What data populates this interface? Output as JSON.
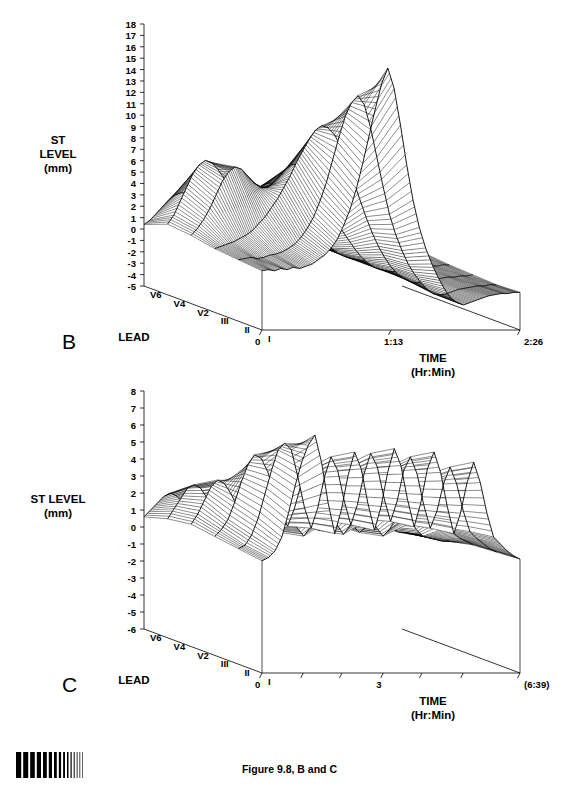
{
  "figure": {
    "caption": "Figure 9.8, B and C",
    "density_bar_name": "density-calibration-bar"
  },
  "panels": [
    {
      "id": "B",
      "letter": "B",
      "z_axis": {
        "title_lines": [
          "ST",
          "LEVEL",
          "(mm)"
        ],
        "ticks": [
          18,
          17,
          16,
          15,
          14,
          13,
          12,
          11,
          10,
          9,
          8,
          7,
          6,
          5,
          4,
          3,
          2,
          1,
          0,
          -1,
          -2,
          -3,
          -4,
          -5
        ],
        "min": -5,
        "max": 18
      },
      "lead_axis": {
        "title": "LEAD",
        "labels": [
          "V6",
          "V4",
          "V2",
          "III",
          "II",
          "I"
        ]
      },
      "time_axis": {
        "title_lines": [
          "TIME",
          "(Hr:Min)"
        ],
        "tick_labels": [
          "0",
          "1:13",
          "2:26"
        ],
        "tick_positions": [
          0,
          0.5,
          1.0
        ]
      }
    },
    {
      "id": "C",
      "letter": "C",
      "z_axis": {
        "title_lines": [
          "ST LEVEL",
          "(mm)"
        ],
        "ticks": [
          8,
          7,
          6,
          5,
          4,
          3,
          2,
          1,
          0,
          -1,
          -2,
          -3,
          -4,
          -5,
          -6
        ],
        "min": -6,
        "max": 8
      },
      "lead_axis": {
        "title": "LEAD",
        "labels": [
          "V6",
          "V4",
          "V2",
          "III",
          "II",
          "I"
        ]
      },
      "time_axis": {
        "title_lines": [
          "TIME",
          "(Hr:Min)"
        ],
        "tick_labels": [
          "0",
          "3",
          "(6:39)"
        ],
        "tick_positions": [
          0,
          0.47,
          1.0
        ],
        "minor_tick_positions": [
          0.16,
          0.31,
          0.62,
          0.78
        ]
      }
    }
  ],
  "chart_data": [
    {
      "type": "surface",
      "panel": "B",
      "title": "",
      "xlabel": "TIME (Hr:Min)",
      "ylabel": "LEAD",
      "zlabel": "ST LEVEL (mm)",
      "zlim": [
        -5,
        18
      ],
      "xlim_labels": [
        "0",
        "2:26"
      ],
      "grid": false,
      "legend": "none",
      "y_categories": [
        "I",
        "II",
        "III",
        "V2",
        "V4",
        "V6"
      ],
      "x_count": 42,
      "series": [
        {
          "name": "I",
          "values": [
            0.2,
            0.3,
            0.2,
            0.4,
            0.3,
            0.5,
            0.4,
            0.6,
            0.8,
            1.2,
            1.6,
            2.2,
            3.0,
            4.2,
            5.6,
            7.4,
            9.6,
            12.0,
            14.4,
            16.6,
            18.0,
            16.2,
            13.0,
            9.5,
            6.4,
            4.0,
            2.2,
            0.8,
            -0.4,
            -1.4,
            -2.2,
            -2.6,
            -2.8,
            -2.6,
            -2.4,
            -2.2,
            -2.0,
            -1.9,
            -1.8,
            -1.8,
            -1.7,
            -1.7
          ]
        },
        {
          "name": "II",
          "values": [
            0.4,
            0.5,
            0.6,
            0.5,
            0.6,
            0.8,
            0.9,
            1.1,
            1.4,
            1.8,
            2.4,
            3.2,
            4.2,
            5.6,
            7.2,
            9.2,
            11.2,
            13.0,
            14.2,
            14.8,
            14.0,
            12.0,
            9.4,
            6.8,
            4.4,
            2.6,
            1.2,
            0.0,
            -0.9,
            -1.6,
            -2.2,
            -2.6,
            -2.7,
            -2.6,
            -2.4,
            -2.2,
            -2.1,
            -2.0,
            -1.9,
            -1.9,
            -1.8,
            -1.8
          ]
        },
        {
          "name": "III",
          "values": [
            0.6,
            0.8,
            1.0,
            1.2,
            1.5,
            1.8,
            2.2,
            2.8,
            3.4,
            4.2,
            5.0,
            6.0,
            7.0,
            8.2,
            9.2,
            10.2,
            11.0,
            11.4,
            11.2,
            10.6,
            9.6,
            8.2,
            6.6,
            5.0,
            3.4,
            2.0,
            0.8,
            -0.2,
            -1.0,
            -1.6,
            -2.0,
            -2.3,
            -2.4,
            -2.3,
            -2.2,
            -2.1,
            -2.0,
            -1.9,
            -1.9,
            -1.8,
            -1.8,
            -1.7
          ]
        },
        {
          "name": "V2",
          "values": [
            1.0,
            1.6,
            2.4,
            3.4,
            4.6,
            5.8,
            6.6,
            7.0,
            6.8,
            6.2,
            5.6,
            5.2,
            5.2,
            5.6,
            6.2,
            6.8,
            7.2,
            7.2,
            6.8,
            6.2,
            5.4,
            4.4,
            3.4,
            2.4,
            1.4,
            0.6,
            -0.2,
            -0.9,
            -1.4,
            -1.8,
            -2.0,
            -2.1,
            -2.2,
            -2.1,
            -2.0,
            -1.9,
            -1.8,
            -1.8,
            -1.7,
            -1.7,
            -1.6,
            -1.6
          ]
        },
        {
          "name": "V4",
          "values": [
            1.2,
            2.0,
            3.2,
            4.4,
            5.6,
            6.4,
            6.8,
            6.6,
            6.0,
            5.2,
            4.4,
            3.8,
            3.6,
            3.8,
            4.2,
            4.6,
            4.8,
            4.8,
            4.4,
            3.8,
            3.2,
            2.4,
            1.6,
            0.9,
            0.2,
            -0.4,
            -0.9,
            -1.3,
            -1.6,
            -1.8,
            -1.9,
            -2.0,
            -2.0,
            -1.9,
            -1.8,
            -1.8,
            -1.7,
            -1.6,
            -1.6,
            -1.5,
            -1.5,
            -1.4
          ]
        },
        {
          "name": "V6",
          "values": [
            0.4,
            0.8,
            1.4,
            2.0,
            2.6,
            3.0,
            3.2,
            3.0,
            2.6,
            2.2,
            1.8,
            1.6,
            1.5,
            1.6,
            1.8,
            2.0,
            2.0,
            1.9,
            1.7,
            1.4,
            1.0,
            0.6,
            0.2,
            -0.2,
            -0.6,
            -0.9,
            -1.2,
            -1.4,
            -1.5,
            -1.6,
            -1.7,
            -1.7,
            -1.7,
            -1.6,
            -1.6,
            -1.5,
            -1.5,
            -1.4,
            -1.4,
            -1.3,
            -1.3,
            -1.2
          ]
        }
      ]
    },
    {
      "type": "surface",
      "panel": "C",
      "title": "",
      "xlabel": "TIME (Hr:Min)",
      "ylabel": "LEAD",
      "zlabel": "ST LEVEL (mm)",
      "zlim": [
        -6,
        8
      ],
      "xlim_labels": [
        "0",
        "(6:39)"
      ],
      "grid": false,
      "legend": "none",
      "y_categories": [
        "I",
        "II",
        "III",
        "V2",
        "V4",
        "V6"
      ],
      "x_count": 40,
      "series": [
        {
          "name": "I",
          "values": [
            0.6,
            0.8,
            1.2,
            2.0,
            3.4,
            5.0,
            6.4,
            7.4,
            8.0,
            6.4,
            4.0,
            2.2,
            3.6,
            5.6,
            7.0,
            6.0,
            4.0,
            2.4,
            3.8,
            5.8,
            7.2,
            6.2,
            4.2,
            2.6,
            4.0,
            6.0,
            7.0,
            5.8,
            3.8,
            2.2,
            3.4,
            5.2,
            6.4,
            5.2,
            3.4,
            2.0,
            1.6,
            1.2,
            0.9,
            0.7
          ]
        },
        {
          "name": "II",
          "values": [
            0.8,
            1.0,
            1.6,
            2.6,
            4.0,
            5.4,
            6.6,
            7.0,
            6.6,
            5.0,
            3.2,
            2.0,
            3.2,
            5.0,
            6.2,
            5.4,
            3.6,
            2.2,
            3.4,
            5.2,
            6.4,
            5.6,
            3.8,
            2.4,
            3.6,
            5.4,
            6.2,
            5.2,
            3.4,
            2.0,
            3.0,
            4.6,
            5.6,
            4.6,
            3.0,
            1.8,
            1.4,
            1.1,
            0.8,
            0.6
          ]
        },
        {
          "name": "III",
          "values": [
            1.0,
            1.4,
            2.0,
            3.0,
            4.2,
            5.2,
            5.8,
            5.6,
            4.8,
            3.6,
            2.4,
            1.6,
            2.6,
            4.0,
            5.0,
            4.4,
            3.0,
            1.9,
            2.8,
            4.2,
            5.2,
            4.6,
            3.2,
            2.0,
            3.0,
            4.4,
            5.0,
            4.2,
            2.8,
            1.7,
            2.5,
            3.8,
            4.6,
            3.8,
            2.5,
            1.5,
            1.2,
            0.9,
            0.7,
            0.5
          ]
        },
        {
          "name": "V2",
          "values": [
            1.2,
            1.8,
            2.6,
            3.4,
            3.8,
            3.6,
            3.0,
            2.2,
            1.4,
            0.8,
            0.4,
            0.2,
            0.8,
            1.6,
            2.2,
            1.8,
            1.0,
            0.5,
            1.0,
            1.8,
            2.4,
            2.0,
            1.2,
            0.6,
            1.1,
            1.9,
            2.2,
            1.8,
            1.0,
            0.5,
            0.9,
            1.6,
            2.0,
            1.6,
            0.9,
            0.5,
            0.4,
            0.3,
            0.2,
            0.2
          ]
        },
        {
          "name": "V4",
          "values": [
            1.0,
            1.6,
            2.2,
            2.8,
            3.0,
            2.8,
            2.2,
            1.6,
            1.0,
            0.5,
            0.2,
            0.0,
            0.4,
            1.0,
            1.5,
            1.2,
            0.6,
            0.2,
            0.6,
            1.2,
            1.6,
            1.3,
            0.7,
            0.3,
            0.7,
            1.3,
            1.5,
            1.2,
            0.6,
            0.2,
            0.5,
            1.0,
            1.3,
            1.0,
            0.5,
            0.2,
            0.2,
            0.1,
            0.1,
            0.1
          ]
        },
        {
          "name": "V6",
          "values": [
            0.6,
            1.0,
            1.4,
            1.8,
            2.0,
            1.8,
            1.4,
            1.0,
            0.6,
            0.3,
            0.1,
            0.0,
            0.2,
            0.6,
            0.9,
            0.7,
            0.3,
            0.1,
            0.3,
            0.7,
            1.0,
            0.8,
            0.4,
            0.1,
            0.4,
            0.8,
            0.9,
            0.7,
            0.3,
            0.1,
            0.3,
            0.6,
            0.8,
            0.6,
            0.3,
            0.1,
            0.1,
            0.1,
            0.0,
            0.0
          ]
        }
      ]
    }
  ]
}
